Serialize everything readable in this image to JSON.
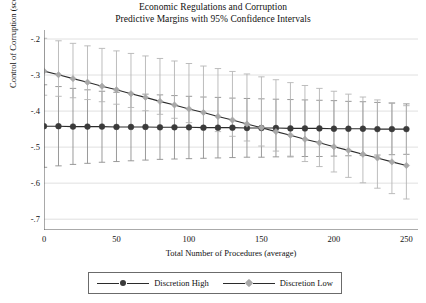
{
  "chart_data": {
    "type": "line",
    "title": "Economic Regulations and Corruption",
    "subtitle": "Predictive Margins with 95% Confidence Intervals",
    "xlabel": "Total Number of Procedures (average)",
    "ylabel": "Control of Corruption (score)",
    "xlim": [
      0,
      258
    ],
    "ylim": [
      -0.73,
      -0.175
    ],
    "xticks": [
      0,
      50,
      100,
      150,
      200,
      250
    ],
    "xtick_labels": [
      "0",
      "50",
      "100",
      "150",
      "200",
      "250"
    ],
    "yticks": [
      -0.2,
      -0.3,
      -0.4,
      -0.5,
      -0.6,
      -0.7
    ],
    "ytick_labels": [
      "-.2",
      "-.3",
      "-.4",
      "-.5",
      "-.6",
      "-.7"
    ],
    "grid": "horizontal",
    "legend_position": "bottom",
    "x": [
      0,
      10,
      20,
      30,
      40,
      50,
      60,
      70,
      80,
      90,
      100,
      110,
      120,
      130,
      140,
      150,
      160,
      170,
      180,
      190,
      200,
      210,
      220,
      230,
      240,
      250
    ],
    "series": [
      {
        "name": "Discretion High",
        "color": "#3a3a3a",
        "marker": "circle",
        "values": [
          -0.442,
          -0.442,
          -0.443,
          -0.443,
          -0.443,
          -0.444,
          -0.444,
          -0.444,
          -0.445,
          -0.445,
          -0.445,
          -0.446,
          -0.446,
          -0.446,
          -0.447,
          -0.447,
          -0.447,
          -0.448,
          -0.448,
          -0.448,
          -0.449,
          -0.449,
          -0.449,
          -0.45,
          -0.45,
          -0.45
        ],
        "ci_lower": [
          -0.556,
          -0.552,
          -0.548,
          -0.545,
          -0.542,
          -0.54,
          -0.538,
          -0.536,
          -0.534,
          -0.533,
          -0.532,
          -0.531,
          -0.53,
          -0.529,
          -0.528,
          -0.528,
          -0.527,
          -0.527,
          -0.526,
          -0.526,
          -0.525,
          -0.524,
          -0.523,
          -0.522,
          -0.521,
          -0.52
        ],
        "ci_upper": [
          -0.327,
          -0.332,
          -0.337,
          -0.341,
          -0.345,
          -0.348,
          -0.351,
          -0.353,
          -0.355,
          -0.357,
          -0.359,
          -0.361,
          -0.362,
          -0.364,
          -0.365,
          -0.366,
          -0.367,
          -0.368,
          -0.369,
          -0.37,
          -0.371,
          -0.373,
          -0.374,
          -0.376,
          -0.378,
          -0.38
        ]
      },
      {
        "name": "Discretion Low",
        "color": "#a8a8a8",
        "marker": "diamond",
        "values": [
          -0.289,
          -0.299,
          -0.31,
          -0.32,
          -0.331,
          -0.341,
          -0.352,
          -0.362,
          -0.373,
          -0.383,
          -0.394,
          -0.404,
          -0.415,
          -0.425,
          -0.436,
          -0.446,
          -0.457,
          -0.467,
          -0.478,
          -0.488,
          -0.499,
          -0.509,
          -0.52,
          -0.53,
          -0.541,
          -0.551
        ],
        "ci_lower": [
          -0.356,
          -0.359,
          -0.363,
          -0.368,
          -0.374,
          -0.381,
          -0.39,
          -0.399,
          -0.409,
          -0.42,
          -0.432,
          -0.444,
          -0.457,
          -0.47,
          -0.483,
          -0.497,
          -0.511,
          -0.525,
          -0.54,
          -0.554,
          -0.569,
          -0.584,
          -0.599,
          -0.614,
          -0.629,
          -0.644
        ],
        "ci_upper": [
          -0.198,
          -0.205,
          -0.212,
          -0.219,
          -0.226,
          -0.233,
          -0.24,
          -0.247,
          -0.254,
          -0.261,
          -0.268,
          -0.275,
          -0.282,
          -0.29,
          -0.297,
          -0.305,
          -0.313,
          -0.321,
          -0.329,
          -0.337,
          -0.345,
          -0.353,
          -0.361,
          -0.369,
          -0.377,
          -0.385
        ]
      }
    ]
  },
  "legend": {
    "items": [
      {
        "label": "Discretion High"
      },
      {
        "label": "Discretion Low"
      }
    ]
  }
}
